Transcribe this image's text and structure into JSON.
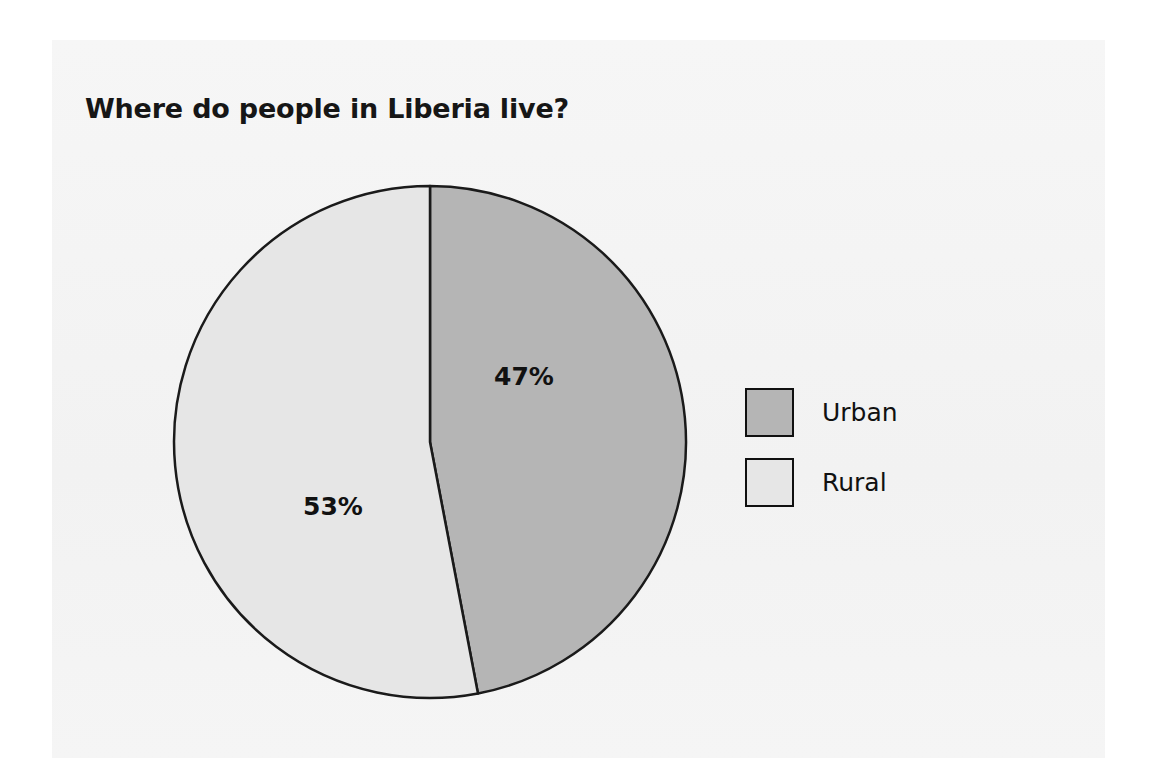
{
  "chart_data": {
    "type": "pie",
    "title": "Where do people in Liberia live?",
    "categories": [
      "Urban",
      "Rural"
    ],
    "values": [
      47,
      53
    ],
    "value_labels": [
      "47%",
      "53%"
    ],
    "units": "percent",
    "colors": [
      "#b5b5b5",
      "#e6e6e6"
    ],
    "slice_stroke": "#1a1a1a",
    "legend": {
      "position": "right",
      "entries": [
        {
          "label": "Urban",
          "color": "#b5b5b5"
        },
        {
          "label": "Rural",
          "color": "#e6e6e6"
        }
      ]
    },
    "xlabel": "",
    "ylabel": "",
    "grid": false,
    "start_angle_deg": 0,
    "direction": "clockwise"
  },
  "page": {
    "background": "#ffffff",
    "panel_background": "#f4f4f4"
  }
}
